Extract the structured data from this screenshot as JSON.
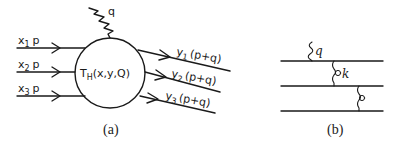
{
  "panel_a": {
    "caption": "(a)",
    "vertex_label": "T",
    "vertex_subscript": "H",
    "vertex_args": "(x,y,Q)",
    "photon_label": "q",
    "incoming": [
      {
        "label": "x",
        "sub": "1",
        "tail": "p"
      },
      {
        "label": "x",
        "sub": "2",
        "tail": "p"
      },
      {
        "label": "x",
        "sub": "3",
        "tail": "p"
      }
    ],
    "outgoing": [
      {
        "label": "y",
        "sub": "1",
        "tail": "(p+q)"
      },
      {
        "label": "y",
        "sub": "2",
        "tail": "(p+q)"
      },
      {
        "label": "y",
        "sub": "3",
        "tail": "(p+q)"
      }
    ]
  },
  "panel_b": {
    "caption": "(b)",
    "photon_label": "q",
    "gluon_label": "k",
    "line_count": 3
  },
  "colors": {
    "ink": "#1a1a1a",
    "background": "#ffffff"
  }
}
